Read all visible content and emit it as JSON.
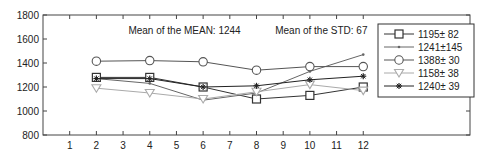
{
  "chart_data": {
    "type": "line",
    "title": "",
    "xlabel": "",
    "ylabel": "",
    "xlim": [
      0,
      16
    ],
    "ylim": [
      800,
      1800
    ],
    "xticks": [
      1,
      2,
      3,
      4,
      5,
      6,
      7,
      8,
      9,
      10,
      11,
      12
    ],
    "yticks": [
      800,
      1000,
      1200,
      1400,
      1600,
      1800
    ],
    "grid": false,
    "legend_position": "upper right",
    "annotations": [
      {
        "text": "Mean of the MEAN: 1244",
        "x": 3.2,
        "y": 1640
      },
      {
        "text": "Mean of the STD: 67",
        "x": 8.7,
        "y": 1640
      }
    ],
    "x": [
      2,
      4,
      6,
      8,
      10,
      12
    ],
    "series": [
      {
        "name": "1195± 82",
        "marker": "square",
        "color": "#333333",
        "values": [
          1280,
          1280,
          1200,
          1100,
          1130,
          1200
        ]
      },
      {
        "name": "1241±145",
        "marker": "point",
        "color": "#666666",
        "values": [
          1270,
          1230,
          1090,
          1150,
          1330,
          1470
        ]
      },
      {
        "name": "1388± 30",
        "marker": "circle",
        "color": "#555555",
        "values": [
          1415,
          1420,
          1410,
          1340,
          1370,
          1370
        ]
      },
      {
        "name": "1158± 38",
        "marker": "triangle-down",
        "color": "#aaaaaa",
        "values": [
          1190,
          1150,
          1100,
          1160,
          1220,
          1170
        ]
      },
      {
        "name": "1240± 39",
        "marker": "asterisk",
        "color": "#222222",
        "values": [
          1270,
          1270,
          1200,
          1210,
          1260,
          1290
        ]
      }
    ]
  }
}
